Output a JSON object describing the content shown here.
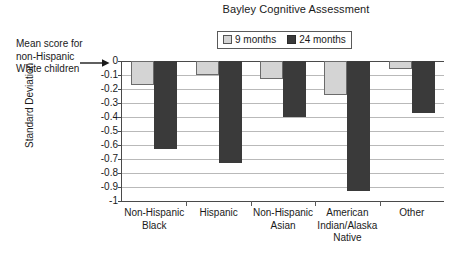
{
  "chart_data": {
    "type": "bar",
    "title": "Bayley Cognitive Assessment",
    "xlabel": "",
    "ylabel": "Standard Deviation",
    "ylim": [
      -1,
      0
    ],
    "grid": true,
    "legend_position": "top-center",
    "categories": [
      "Non-Hispanic\nBlack",
      "Hispanic",
      "Non-Hispanic\nAsian",
      "American\nIndian/Alaska\nNative",
      "Other"
    ],
    "series": [
      {
        "name": "9 months",
        "color": "#d4d4d4",
        "values": [
          -0.17,
          -0.1,
          -0.13,
          -0.24,
          -0.06
        ]
      },
      {
        "name": "24 months",
        "color": "#3a3a3a",
        "values": [
          -0.63,
          -0.73,
          -0.4,
          -0.93,
          -0.37
        ]
      }
    ],
    "ytick_labels": [
      "0",
      "-0.1",
      "-0.2",
      "-0.3",
      "-0.4",
      "-0.5",
      "-0.6",
      "-0.7",
      "-0.8",
      "-0.9",
      "-1"
    ],
    "ytick_values": [
      0,
      -0.1,
      -0.2,
      -0.3,
      -0.4,
      -0.5,
      -0.6,
      -0.7,
      -0.8,
      -0.9,
      -1
    ],
    "annotation": {
      "lines": [
        "Mean score for",
        "non-Hispanic",
        "White children"
      ],
      "points_to": "0"
    }
  }
}
